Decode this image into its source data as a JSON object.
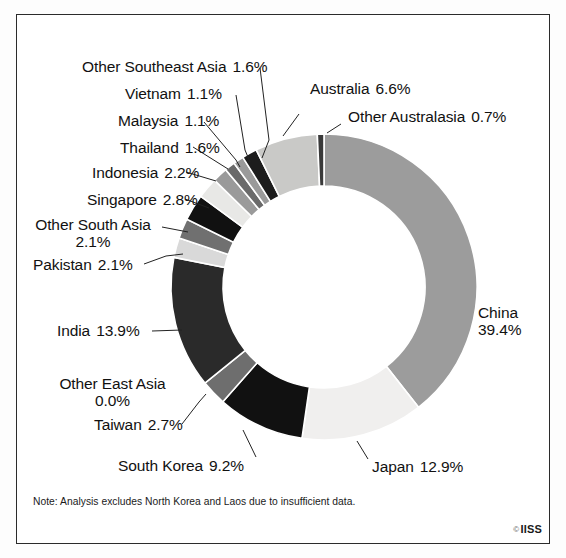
{
  "figure": {
    "note": "Note: Analysis excludes North Korea and Laos due to insufficient data.",
    "credit_symbol": "©",
    "credit": "IISS"
  },
  "chart_data": {
    "type": "pie",
    "variant": "donut",
    "title": "",
    "subtitle": "",
    "xlabel": "",
    "ylabel": "",
    "units": "%",
    "legend_position": "none",
    "labels_position": "outside-with-leader-lines",
    "grid": false,
    "total": 100.0,
    "start_angle_deg": 0,
    "direction": "clockwise-for-china-then-counterclockwise-listing",
    "categories": [
      "China",
      "Japan",
      "South Korea",
      "Taiwan",
      "Other East Asia",
      "India",
      "Pakistan",
      "Other South Asia",
      "Singapore",
      "Indonesia",
      "Thailand",
      "Malaysia",
      "Vietnam",
      "Other Southeast Asia",
      "Australia",
      "Other Australasia"
    ],
    "values": [
      39.4,
      12.9,
      9.2,
      2.7,
      0.0,
      13.9,
      2.1,
      2.1,
      2.8,
      2.2,
      1.6,
      1.1,
      1.1,
      1.6,
      6.6,
      0.7
    ],
    "slices": [
      {
        "name": "China",
        "value": 39.4,
        "label": "China",
        "pct": "39.4%",
        "color": "#9c9c9c"
      },
      {
        "name": "Japan",
        "value": 12.9,
        "label": "Japan",
        "pct": "12.9%",
        "color": "#f0efee"
      },
      {
        "name": "South Korea",
        "value": 9.2,
        "label": "South Korea",
        "pct": "9.2%",
        "color": "#111111"
      },
      {
        "name": "Taiwan",
        "value": 2.7,
        "label": "Taiwan",
        "pct": "2.7%",
        "color": "#6e6e6e"
      },
      {
        "name": "Other East Asia",
        "value": 0.0,
        "label": "Other East Asia",
        "pct": "0.0%",
        "color": "#c8c8c8"
      },
      {
        "name": "India",
        "value": 13.9,
        "label": "India",
        "pct": "13.9%",
        "color": "#2a2a2a"
      },
      {
        "name": "Pakistan",
        "value": 2.1,
        "label": "Pakistan",
        "pct": "2.1%",
        "color": "#d9d9d9"
      },
      {
        "name": "Other South Asia",
        "value": 2.1,
        "label": "Other South Asia",
        "pct": "2.1%",
        "color": "#707070"
      },
      {
        "name": "Singapore",
        "value": 2.8,
        "label": "Singapore",
        "pct": "2.8%",
        "color": "#111111"
      },
      {
        "name": "Indonesia",
        "value": 2.2,
        "label": "Indonesia",
        "pct": "2.2%",
        "color": "#e8e8e6"
      },
      {
        "name": "Thailand",
        "value": 1.6,
        "label": "Thailand",
        "pct": "1.6%",
        "color": "#9a9a9a"
      },
      {
        "name": "Malaysia",
        "value": 1.1,
        "label": "Malaysia",
        "pct": "1.1%",
        "color": "#6a6a6a"
      },
      {
        "name": "Vietnam",
        "value": 1.1,
        "label": "Vietnam",
        "pct": "1.1%",
        "color": "#9a9a9a"
      },
      {
        "name": "Other Southeast Asia",
        "value": 1.6,
        "label": "Other Southeast Asia",
        "pct": "1.6%",
        "color": "#1c1c1c"
      },
      {
        "name": "Australia",
        "value": 6.6,
        "label": "Australia",
        "pct": "6.6%",
        "color": "#c9c9c7"
      },
      {
        "name": "Other Australasia",
        "value": 0.7,
        "label": "Other Australasia",
        "pct": "0.7%",
        "color": "#3a3a3a"
      }
    ]
  }
}
